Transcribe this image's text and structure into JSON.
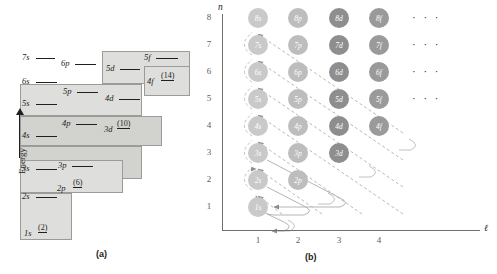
{
  "figure": {
    "panel_a": {
      "caption": "(a)",
      "energy_axis_label": "Energy",
      "levels": [
        {
          "id": "7s",
          "label": "7s",
          "capacity": null
        },
        {
          "id": "6p",
          "label": "6p",
          "capacity": null
        },
        {
          "id": "5f",
          "label": "5f",
          "capacity": null
        },
        {
          "id": "5d",
          "label": "5d",
          "capacity": null
        },
        {
          "id": "4f",
          "label": "4f",
          "capacity": "(14)"
        },
        {
          "id": "6s",
          "label": "6s",
          "capacity": null
        },
        {
          "id": "5p",
          "label": "5p",
          "capacity": null
        },
        {
          "id": "4d",
          "label": "4d",
          "capacity": null
        },
        {
          "id": "5s",
          "label": "5s",
          "capacity": null
        },
        {
          "id": "4p",
          "label": "4p",
          "capacity": null
        },
        {
          "id": "3d",
          "label": "3d",
          "capacity": "(10)"
        },
        {
          "id": "4s",
          "label": "4s",
          "capacity": null
        },
        {
          "id": "3p",
          "label": "3p",
          "capacity": null
        },
        {
          "id": "3s",
          "label": "3s",
          "capacity": null
        },
        {
          "id": "2p",
          "label": "2p",
          "capacity": "(6)"
        },
        {
          "id": "2s",
          "label": "2s",
          "capacity": null
        },
        {
          "id": "1s",
          "label": "1s",
          "capacity": "(2)"
        }
      ]
    },
    "panel_b": {
      "caption": "(b)",
      "y_axis_label": "n",
      "x_axis_label": "ℓ",
      "y_ticks": [
        "1",
        "2",
        "3",
        "4",
        "5",
        "6",
        "7",
        "8"
      ],
      "x_ticks": [
        "1",
        "2",
        "3",
        "4"
      ],
      "ellipsis": "· · ·",
      "ellipsis_rows": [
        "8",
        "7",
        "6",
        "5"
      ],
      "columns": [
        "s",
        "p",
        "d",
        "f"
      ],
      "orbitals": [
        {
          "n": 8,
          "l": "s",
          "label": "8s"
        },
        {
          "n": 8,
          "l": "p",
          "label": "8p"
        },
        {
          "n": 8,
          "l": "d",
          "label": "8d"
        },
        {
          "n": 8,
          "l": "f",
          "label": "8f"
        },
        {
          "n": 7,
          "l": "s",
          "label": "7s"
        },
        {
          "n": 7,
          "l": "p",
          "label": "7p"
        },
        {
          "n": 7,
          "l": "d",
          "label": "7d"
        },
        {
          "n": 7,
          "l": "f",
          "label": "7f"
        },
        {
          "n": 6,
          "l": "s",
          "label": "6s"
        },
        {
          "n": 6,
          "l": "p",
          "label": "6p"
        },
        {
          "n": 6,
          "l": "d",
          "label": "6d"
        },
        {
          "n": 6,
          "l": "f",
          "label": "6f"
        },
        {
          "n": 5,
          "l": "s",
          "label": "5s"
        },
        {
          "n": 5,
          "l": "p",
          "label": "5p"
        },
        {
          "n": 5,
          "l": "d",
          "label": "5d"
        },
        {
          "n": 5,
          "l": "f",
          "label": "5f"
        },
        {
          "n": 4,
          "l": "s",
          "label": "4s"
        },
        {
          "n": 4,
          "l": "p",
          "label": "4p"
        },
        {
          "n": 4,
          "l": "d",
          "label": "4d"
        },
        {
          "n": 4,
          "l": "f",
          "label": "4f"
        },
        {
          "n": 3,
          "l": "s",
          "label": "3s"
        },
        {
          "n": 3,
          "l": "p",
          "label": "3p"
        },
        {
          "n": 3,
          "l": "d",
          "label": "3d"
        },
        {
          "n": 2,
          "l": "s",
          "label": "2s"
        },
        {
          "n": 2,
          "l": "p",
          "label": "2p"
        },
        {
          "n": 1,
          "l": "s",
          "label": "1s"
        }
      ]
    }
  },
  "colors": {
    "box_fill": "#dededc",
    "box_border": "#9b9b99",
    "orb_s": "#c9c9c9",
    "orb_p": "#bdbdbd",
    "orb_d": "#8e8e8e",
    "orb_f": "#9a9a9a",
    "axis": "#6f6f6f",
    "text": "#231f20"
  }
}
